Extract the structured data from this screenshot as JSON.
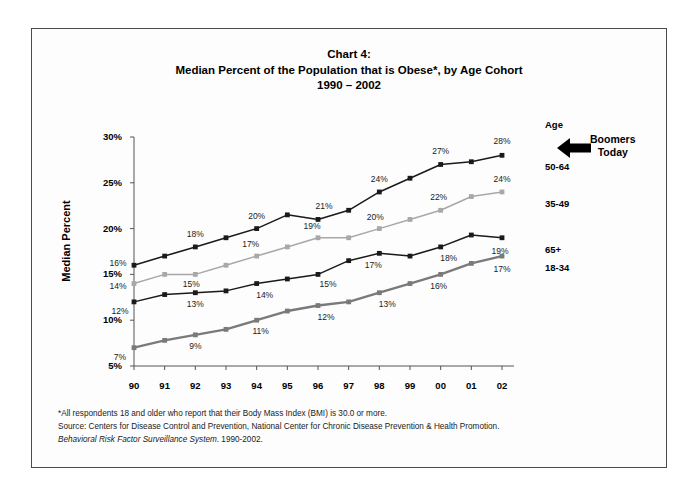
{
  "title": {
    "line1": "Chart 4:",
    "line2": "Median Percent of the Population that is Obese*, by Age Cohort",
    "line3": "1990 – 2002"
  },
  "axes": {
    "ylabel": "Median Percent",
    "yticks": [
      "30%",
      "25%",
      "20%",
      "15%",
      "10%",
      "5%"
    ],
    "xticks": [
      "90",
      "91",
      "92",
      "93",
      "94",
      "95",
      "96",
      "97",
      "98",
      "99",
      "00",
      "01",
      "02"
    ]
  },
  "legend": {
    "header": "Age",
    "items": [
      "50-64",
      "35-49",
      "65+",
      "18-34"
    ]
  },
  "annotation": {
    "icon": "left-arrow-icon",
    "line1": "Boomers",
    "line2": "Today"
  },
  "footnotes": {
    "line1": "*All respondents 18 and older who report that their Body Mass Index (BMI) is 30.0 or more.",
    "line2": "Source: Centers for Disease Control and Prevention, National Center for Chronic Disease Prevention & Health Promotion.",
    "line3_italic": "Behavioral Risk Factor Surveillance System",
    "line3_rest": ". 1990-2002."
  },
  "chart_data": {
    "type": "line",
    "title": "Median Percent of the Population that is Obese*, by Age Cohort 1990 – 2002",
    "xlabel": "",
    "ylabel": "Median Percent",
    "ylim": [
      5,
      30
    ],
    "ytick_step": 5,
    "grid": false,
    "legend_position": "right",
    "categories": [
      "90",
      "91",
      "92",
      "93",
      "94",
      "95",
      "96",
      "97",
      "98",
      "99",
      "00",
      "01",
      "02"
    ],
    "series": [
      {
        "name": "50-64",
        "color": "#1a1a1a",
        "values": [
          16,
          17,
          18,
          19,
          20,
          21.5,
          21,
          22,
          24,
          25.5,
          27,
          27.3,
          28
        ],
        "labels": [
          "16%",
          "",
          "18%",
          "",
          "20%",
          "",
          "21%",
          "",
          "24%",
          "",
          "27%",
          "",
          "28%"
        ]
      },
      {
        "name": "35-49",
        "color": "#a8a8a8",
        "values": [
          14,
          15,
          15,
          16,
          17,
          18,
          19,
          19,
          20,
          21,
          22,
          23.5,
          24
        ],
        "labels": [
          "14%",
          "",
          "15%",
          "",
          "17%",
          "",
          "19%",
          "",
          "20%",
          "",
          "22%",
          "",
          "24%"
        ]
      },
      {
        "name": "65+",
        "color": "#1a1a1a",
        "values": [
          12,
          12.8,
          13,
          13.2,
          14,
          14.5,
          15,
          16.5,
          17.3,
          17,
          18,
          19.3,
          19
        ],
        "labels": [
          "12%",
          "",
          "13%",
          "",
          "14%",
          "",
          "15%",
          "",
          "17%",
          "",
          "18%",
          "",
          "19%"
        ]
      },
      {
        "name": "18-34",
        "color": "#7a7a7a",
        "values": [
          7,
          7.8,
          8.4,
          9,
          10,
          11,
          11.6,
          12,
          13,
          14,
          15,
          16.2,
          17
        ],
        "labels": [
          "7%",
          "",
          "9%",
          "",
          "11%",
          "",
          "12%",
          "",
          "13%",
          "",
          "16%",
          "",
          "17%"
        ]
      }
    ]
  }
}
